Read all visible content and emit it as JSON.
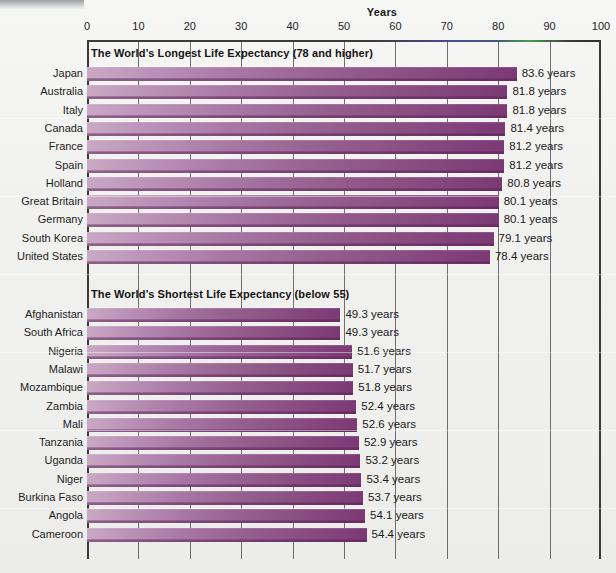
{
  "chart_data": {
    "type": "bar",
    "orientation": "horizontal",
    "title": "Years",
    "xlabel": "Years",
    "ylabel": "",
    "xlim": [
      0,
      100
    ],
    "xticks": [
      0,
      10,
      20,
      30,
      40,
      50,
      60,
      70,
      80,
      90,
      100
    ],
    "grid": true,
    "legend": "none",
    "value_suffix": "years",
    "panels": [
      {
        "header": "The World’s Longest Life Expectancy (78 and higher)",
        "categories": [
          "Japan",
          "Australia",
          "Italy",
          "Canada",
          "France",
          "Spain",
          "Holland",
          "Great Britain",
          "Germany",
          "South Korea",
          "United States"
        ],
        "values": [
          83.6,
          81.8,
          81.8,
          81.4,
          81.2,
          81.2,
          80.8,
          80.1,
          80.1,
          79.1,
          78.4
        ],
        "value_labels": [
          "83.6 years",
          "81.8 years",
          "81.8 years",
          "81.4 years",
          "81.2 years",
          "81.2 years",
          "80.8 years",
          "80.1 years",
          "80.1 years",
          "79.1 years",
          "78.4 years"
        ]
      },
      {
        "header": "The World’s Shortest Life Expectancy (below 55)",
        "categories": [
          "Afghanistan",
          "South Africa",
          "Nigeria",
          "Malawi",
          "Mozambique",
          "Zambia",
          "Mali",
          "Tanzania",
          "Uganda",
          "Niger",
          "Burkina Faso",
          "Angola",
          "Cameroon"
        ],
        "values": [
          49.3,
          49.3,
          51.6,
          51.7,
          51.8,
          52.4,
          52.6,
          52.9,
          53.2,
          53.4,
          53.7,
          54.1,
          54.4
        ],
        "value_labels": [
          "49.3 years",
          "49.3 years",
          "51.6 years",
          "51.7 years",
          "51.8 years",
          "52.4 years",
          "52.6 years",
          "52.9 years",
          "53.2 years",
          "53.4 years",
          "53.7 years",
          "54.1 years",
          "54.4 years"
        ]
      }
    ],
    "colors": {
      "bar_light": "#c9a9c4",
      "bar_dark": "#7c3a74",
      "axis": "#3a3a3a",
      "gridline": "#6e6e6e",
      "text": "#1a1a1a",
      "background": "#f1f1ef"
    }
  }
}
